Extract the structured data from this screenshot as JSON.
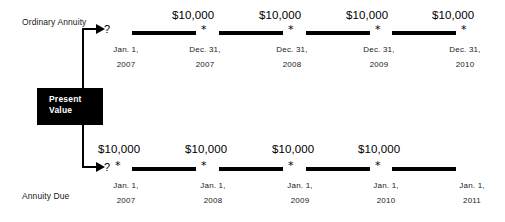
{
  "diagram": {
    "title_top": "Ordinary Annuity",
    "title_bottom": "Annuity Due",
    "present_value": {
      "line1": "Present",
      "line2": "Value"
    },
    "unknown_marker": "?",
    "payment_marker": "*"
  },
  "ordinary_annuity": {
    "label": "Ordinary Annuity",
    "start": {
      "unknown": "?",
      "date_line1": "Jan.  1,",
      "date_line2": "2007"
    },
    "payments": [
      {
        "amount": "$10,000",
        "marker": "*",
        "date_line1": "Dec.  31,",
        "date_line2": "2007"
      },
      {
        "amount": "$10,000",
        "marker": "*",
        "date_line1": "Dec.  31,",
        "date_line2": "2008"
      },
      {
        "amount": "$10,000",
        "marker": "*",
        "date_line1": "Dec.  31,",
        "date_line2": "2009"
      },
      {
        "amount": "$10,000",
        "marker": "*",
        "date_line1": "Dec.  31,",
        "date_line2": "2010"
      }
    ]
  },
  "annuity_due": {
    "label": "Annuity Due",
    "start": {
      "unknown": "?"
    },
    "payments": [
      {
        "amount": "$10,000",
        "marker": "*",
        "date_line1": "Jan.  1,",
        "date_line2": "2007"
      },
      {
        "amount": "$10,000",
        "marker": "*",
        "date_line1": "Jan.  1,",
        "date_line2": "2008"
      },
      {
        "amount": "$10,000",
        "marker": "*",
        "date_line1": "Jan.  1,",
        "date_line2": "2009"
      },
      {
        "amount": "$10,000",
        "marker": "*",
        "date_line1": "Jan.  1,",
        "date_line2": "2010"
      }
    ],
    "end": {
      "date_line1": "Jan.  1,",
      "date_line2": "2011"
    }
  },
  "colors": {
    "ink": "#000000",
    "background": "#ffffff",
    "box_fill": "#000000",
    "box_text": "#ffffff"
  }
}
